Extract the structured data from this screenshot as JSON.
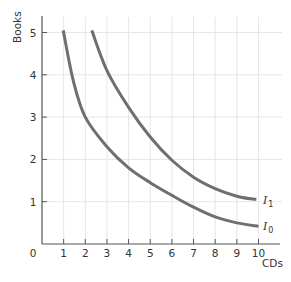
{
  "chart_data": {
    "type": "line",
    "title": "",
    "xlabel": "CDs",
    "ylabel": "Books",
    "xlim": [
      0,
      10.5
    ],
    "ylim": [
      0,
      5.4
    ],
    "x_ticks": [
      0,
      1,
      2,
      3,
      4,
      5,
      6,
      7,
      8,
      9,
      10
    ],
    "y_ticks": [
      1,
      2,
      3,
      4,
      5
    ],
    "grid": true,
    "legend": "inline labels at right end of each curve",
    "series": [
      {
        "name": "I0",
        "label_main": "I",
        "label_sub": "0",
        "x": [
          0.98,
          1.45,
          2.0,
          3.0,
          4.0,
          5.0,
          6.0,
          7.0,
          8.0,
          9.0,
          10.0
        ],
        "y": [
          5.05,
          3.85,
          3.0,
          2.3,
          1.8,
          1.45,
          1.15,
          0.87,
          0.64,
          0.5,
          0.42
        ]
      },
      {
        "name": "I1",
        "label_main": "I",
        "label_sub": "1",
        "x": [
          2.3,
          3.0,
          4.0,
          5.0,
          6.0,
          7.0,
          8.0,
          9.0,
          9.9
        ],
        "y": [
          5.05,
          4.1,
          3.23,
          2.53,
          1.98,
          1.58,
          1.31,
          1.13,
          1.05
        ]
      }
    ],
    "colors": {
      "curve": "#6f6f6f",
      "axis": "#555555",
      "grid": "#e6e6e6",
      "text": "#333333"
    }
  }
}
